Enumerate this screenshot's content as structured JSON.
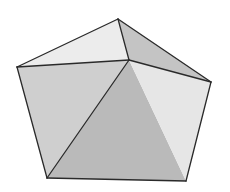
{
  "figure": {
    "background": "#ffffff",
    "edge_color": "#2a2a2a",
    "vertices": {
      "top": [
        118,
        19
      ],
      "left": [
        17,
        67
      ],
      "apex": [
        129,
        60
      ],
      "right": [
        211,
        82
      ],
      "bottom_left": [
        47,
        178
      ],
      "bottom_right": [
        186,
        181
      ]
    },
    "faces": [
      {
        "name": "top-left-face",
        "vertices": [
          "left",
          "top",
          "apex"
        ],
        "color": "#ececec"
      },
      {
        "name": "top-right-face",
        "vertices": [
          "top",
          "right",
          "apex"
        ],
        "color": "#c4c4c4"
      },
      {
        "name": "left-face",
        "vertices": [
          "left",
          "apex",
          "bottom_left"
        ],
        "color": "#cfcfcf"
      },
      {
        "name": "front-face",
        "vertices": [
          "apex",
          "bottom_right",
          "bottom_left"
        ],
        "color": "#bababa"
      },
      {
        "name": "right-face",
        "vertices": [
          "apex",
          "right",
          "bottom_right"
        ],
        "color": "#e6e6e6"
      }
    ],
    "edges": [
      [
        "left",
        "top"
      ],
      [
        "top",
        "right"
      ],
      [
        "right",
        "bottom_right"
      ],
      [
        "bottom_right",
        "bottom_left"
      ],
      [
        "bottom_left",
        "left"
      ],
      [
        "top",
        "apex"
      ],
      [
        "left",
        "apex"
      ],
      [
        "right",
        "apex"
      ],
      [
        "bottom_left",
        "apex"
      ]
    ]
  }
}
